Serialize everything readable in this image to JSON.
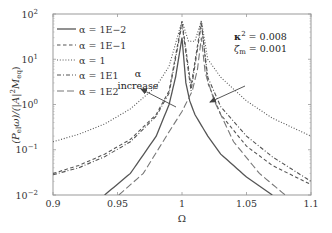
{
  "chart_data": {
    "type": "line",
    "title": "",
    "xlabel": "Ω",
    "ylabel": "(P_el ω)/(|A|² M_eq)",
    "xscale": "linear",
    "yscale": "log",
    "xlim": [
      0.9,
      1.1
    ],
    "ylim": [
      0.01,
      100
    ],
    "x_ticks": [
      0.9,
      0.95,
      1,
      1.05,
      1.1
    ],
    "x_tick_labels": [
      "0.9",
      "0.95",
      "1",
      "1.05",
      "1.1"
    ],
    "y_ticks": [
      0.01,
      0.1,
      1,
      10,
      100
    ],
    "y_tick_labels": [
      "10",
      "10",
      "10",
      "10",
      "10"
    ],
    "y_tick_exponents": [
      "−2",
      "−1",
      "0",
      "1",
      "2"
    ],
    "grid": false,
    "legend_position": "upper left",
    "series": [
      {
        "name": "α = 1E−2",
        "style": "solid",
        "color": "#555555",
        "x": [
          0.94,
          0.96,
          0.98,
          0.99,
          0.995,
          1.0,
          1.003,
          1.006,
          1.01,
          1.02,
          1.03,
          1.05,
          1.07
        ],
        "values": [
          0.01,
          0.03,
          0.2,
          1.0,
          4.0,
          30,
          3.0,
          1.2,
          0.6,
          0.2,
          0.08,
          0.025,
          0.01
        ]
      },
      {
        "name": "α = 1E−1",
        "style": "dashed",
        "color": "#555555",
        "x": [
          0.9,
          0.92,
          0.94,
          0.96,
          0.98,
          0.99,
          1.0,
          1.007,
          1.015,
          1.02,
          1.03,
          1.05,
          1.07,
          1.1
        ],
        "values": [
          0.03,
          0.045,
          0.08,
          0.17,
          0.6,
          2.0,
          70,
          2.5,
          70,
          3.0,
          0.6,
          0.12,
          0.045,
          0.017
        ]
      },
      {
        "name": "α = 1",
        "style": "dotted",
        "color": "#555555",
        "x": [
          0.9,
          0.92,
          0.94,
          0.96,
          0.98,
          0.99,
          1.0,
          1.005,
          1.01,
          1.015,
          1.02,
          1.03,
          1.05,
          1.07,
          1.1
        ],
        "values": [
          0.15,
          0.22,
          0.37,
          0.8,
          2.5,
          7.0,
          70,
          25,
          25,
          70,
          10,
          4.0,
          1.2,
          0.5,
          0.2
        ]
      },
      {
        "name": "α = 1E1",
        "style": "dash-dot",
        "color": "#555555",
        "x": [
          0.9,
          0.92,
          0.94,
          0.96,
          0.98,
          0.99,
          1.0,
          1.007,
          1.015,
          1.02,
          1.03,
          1.05,
          1.07,
          1.1
        ],
        "values": [
          0.028,
          0.04,
          0.07,
          0.15,
          0.55,
          1.8,
          60,
          2.0,
          60,
          4.0,
          0.9,
          0.2,
          0.07,
          0.02
        ]
      },
      {
        "name": "α = 1E2",
        "style": "long-dash",
        "color": "#777777",
        "x": [
          0.951,
          0.97,
          0.99,
          1.0,
          1.008,
          1.012,
          1.015,
          1.018,
          1.025,
          1.04,
          1.06,
          1.08
        ],
        "values": [
          0.01,
          0.03,
          0.25,
          0.7,
          2.0,
          6.0,
          30,
          5.0,
          1.2,
          0.15,
          0.03,
          0.01
        ]
      }
    ],
    "annotations": [
      {
        "text": "κ² = 0.008",
        "position": "upper right"
      },
      {
        "text": "ζm = 0.001",
        "position": "upper right"
      },
      {
        "text": "α",
        "position": "left of peaks"
      },
      {
        "text": "increase",
        "position": "left of peaks"
      }
    ]
  },
  "annotations": {
    "kappa_label": "κ",
    "kappa_exp": "2",
    "kappa_value": " = 0.008",
    "zeta_label": "ζ",
    "zeta_sub": "m",
    "zeta_value": " = 0.001",
    "alpha": "α",
    "increase": "increase"
  },
  "axis": {
    "xlabel": "Ω",
    "ylabel_main": "(P",
    "ylabel_sub1": "el",
    "ylabel_mid": "ω)/(|A|",
    "ylabel_sup": "2",
    "ylabel_M": "M",
    "ylabel_sub2": "eq",
    "ylabel_end": ")"
  }
}
